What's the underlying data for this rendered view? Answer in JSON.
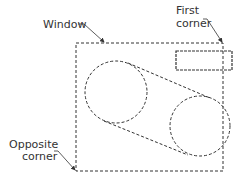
{
  "labels": {
    "window": "Window",
    "first_line1": "First",
    "first_line2": "corner",
    "opposite_line1": "Opposite",
    "opposite_line2": "corner"
  },
  "colors": {
    "stroke": "#333333",
    "background": "#ffffff"
  }
}
